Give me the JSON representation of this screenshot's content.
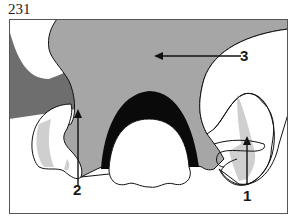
{
  "figure": {
    "number": "231"
  },
  "labels": [
    {
      "id": "1",
      "text": "1"
    },
    {
      "id": "2",
      "text": "2"
    },
    {
      "id": "3",
      "text": "3"
    }
  ],
  "colors": {
    "frame_border": "#555555",
    "soft_tissue_gray": "#a6a6a6",
    "dark_band_gray": "#6e6e6e",
    "light_gray": "#cfcfcf",
    "black_arch": "#0a0a0a",
    "white": "#ffffff",
    "outline": "#111111"
  }
}
